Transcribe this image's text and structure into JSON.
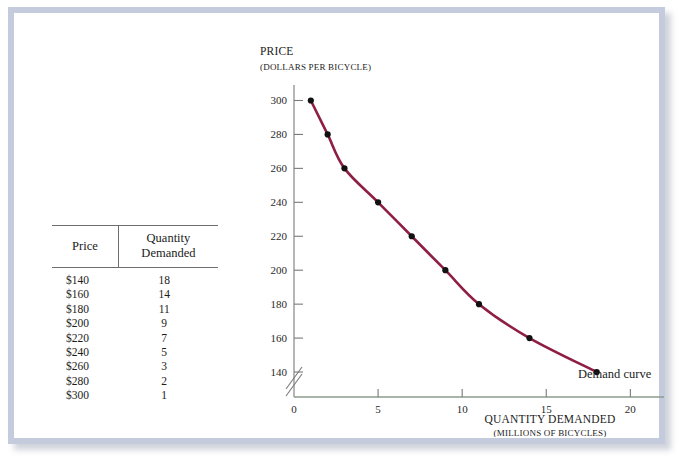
{
  "figure": {
    "frame_color": "#c3cbdd",
    "background": "#ffffff"
  },
  "table": {
    "headers": {
      "price": "Price",
      "quantity": "Quantity Demanded"
    },
    "rows": [
      {
        "price": "$140",
        "quantity": "18"
      },
      {
        "price": "$160",
        "quantity": "14"
      },
      {
        "price": "$180",
        "quantity": "11"
      },
      {
        "price": "$200",
        "quantity": "9"
      },
      {
        "price": "$220",
        "quantity": "7"
      },
      {
        "price": "$240",
        "quantity": "5"
      },
      {
        "price": "$260",
        "quantity": "3"
      },
      {
        "price": "$280",
        "quantity": "2"
      },
      {
        "price": "$300",
        "quantity": "1"
      }
    ]
  },
  "chart_data": {
    "type": "line",
    "title": "",
    "ylabel_main": "Price",
    "ylabel_sub": "(Dollars per bicycle)",
    "xlabel_main": "Quantity demanded",
    "xlabel_sub": "(Millions of bicycles)",
    "xlabel_main_caps": "QUANTITY DEMANDED",
    "xlabel_sub_caps": "(MILLIONS OF BICYCLES)",
    "ylabel_main_caps": "PRICE",
    "ylabel_sub_caps": "(DOLLARS PER BICYCLE)",
    "series_name": "Demand curve",
    "annotation": "Demand curve",
    "x": [
      1,
      2,
      3,
      5,
      7,
      9,
      11,
      14,
      18
    ],
    "y": [
      300,
      280,
      260,
      240,
      220,
      200,
      180,
      160,
      140
    ],
    "xlim": [
      0,
      22
    ],
    "ylim": [
      130,
      305
    ],
    "xticks": [
      0,
      5,
      10,
      15,
      20
    ],
    "xtick_labels": [
      "0",
      "5",
      "10",
      "15",
      "20"
    ],
    "yticks": [
      140,
      160,
      180,
      200,
      220,
      240,
      260,
      280,
      300
    ],
    "ytick_labels": [
      "140",
      "160",
      "180",
      "200",
      "220",
      "240",
      "260",
      "280",
      "300"
    ],
    "grid": false,
    "legend": "none",
    "curve_color": "#8e1e46",
    "marker_color": "#111111",
    "axis_color": "#7a7a7a",
    "y_axis_break": true
  }
}
